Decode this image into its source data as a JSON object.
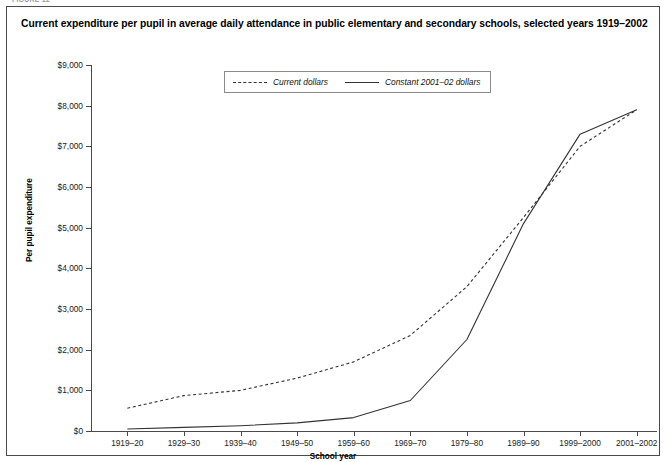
{
  "figure_kicker": "FIGURE 12",
  "title": "Current expenditure per pupil in average daily attendance in public elementary and secondary schools, selected years 1919–2002",
  "legend": {
    "entries": [
      {
        "label": "Current dollars",
        "style": "dashed"
      },
      {
        "label": "Constant 2001–02 dollars",
        "style": "solid"
      }
    ]
  },
  "chart_data": {
    "type": "line",
    "title": "Current expenditure per pupil in average daily attendance in public elementary and secondary schools, selected years 1919–2002",
    "xlabel": "School year",
    "ylabel": "Per pupil expenditure",
    "categories": [
      "1919–20",
      "1929–30",
      "1939–40",
      "1949–50",
      "1959–60",
      "1969–70",
      "1979–80",
      "1989–90",
      "1999–2000",
      "2001–2002"
    ],
    "ylim": [
      0,
      9000
    ],
    "yticks": [
      0,
      1000,
      2000,
      3000,
      4000,
      5000,
      6000,
      7000,
      8000,
      9000
    ],
    "ytick_labels": [
      "$0",
      "$1,000",
      "$2,000",
      "$3,000",
      "$4,000",
      "$5,000",
      "$6,000",
      "$7,000",
      "$8,000",
      "$9,000"
    ],
    "grid": false,
    "legend_position": "top-center",
    "series": [
      {
        "name": "Current dollars",
        "style": "dashed",
        "color": "#333333",
        "values": [
          560,
          870,
          1000,
          1300,
          1700,
          2350,
          3550,
          5250,
          7000,
          7900
        ]
      },
      {
        "name": "Constant 2001–02 dollars",
        "style": "solid",
        "color": "#333333",
        "values": [
          50,
          90,
          130,
          200,
          330,
          750,
          2250,
          5100,
          7300,
          7900
        ]
      }
    ]
  }
}
